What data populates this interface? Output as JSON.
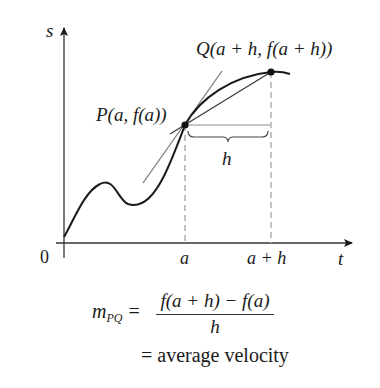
{
  "diagram": {
    "axes": {
      "y_label": "s",
      "x_label": "t",
      "origin_label": "0",
      "tick_a": "a",
      "tick_a_plus_h": "a + h"
    },
    "points": {
      "P": {
        "label": "P(a, f(a))",
        "x": 185,
        "y": 125
      },
      "Q": {
        "label": "Q(a + h, f(a + h))",
        "x": 271,
        "y": 72
      }
    },
    "h_label": "h",
    "formula": {
      "lhs": "m",
      "lhs_sub": "PQ",
      "equals": "=",
      "numerator": "f(a + h) − f(a)",
      "denominator": "h",
      "second_line": "= average velocity"
    },
    "colors": {
      "curve": "#1a1a1a",
      "axis": "#333333",
      "tangent": "#7a7a7a",
      "secant": "#3a3a3a",
      "dashed": "#b5b5b5"
    }
  }
}
